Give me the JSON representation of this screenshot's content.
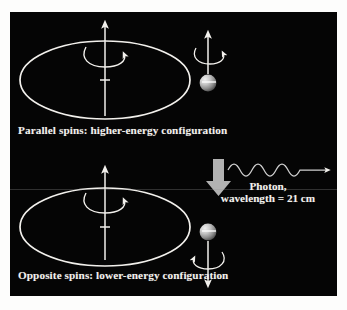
{
  "figure": {
    "title_absent": true,
    "background_color": "#ffffff",
    "panel_color": "#050505",
    "ink_color": "#f2f0ec",
    "accent_gray": "#9a9a9a"
  },
  "top_diagram": {
    "caption": "Parallel spins:  higher-energy configuration",
    "orbit_label": "electron-orbit-ellipse",
    "proton_axis": {
      "direction": "up",
      "spin_rotation": "clockwise-from-above"
    },
    "electron": {
      "spin_arrow_direction": "up",
      "spin_rotation": "clockwise-from-above",
      "sphere_color": "#b8b8b8"
    }
  },
  "transition": {
    "arrow_direction": "down",
    "arrow_color": "#b0b0b0"
  },
  "photon": {
    "wave_label_line1": "Photon,",
    "wave_label_line2": "wavelength = 21 cm",
    "wavelength_value": "21 cm",
    "propagation_direction": "right",
    "wave_cycles": 5
  },
  "bottom_diagram": {
    "caption": "Opposite spins:  lower-energy configuration",
    "orbit_label": "electron-orbit-ellipse",
    "proton_axis": {
      "direction": "up",
      "spin_rotation": "clockwise-from-above"
    },
    "electron": {
      "spin_arrow_direction": "down",
      "spin_rotation": "counterclockwise-from-above",
      "sphere_color": "#b8b8b8"
    }
  }
}
